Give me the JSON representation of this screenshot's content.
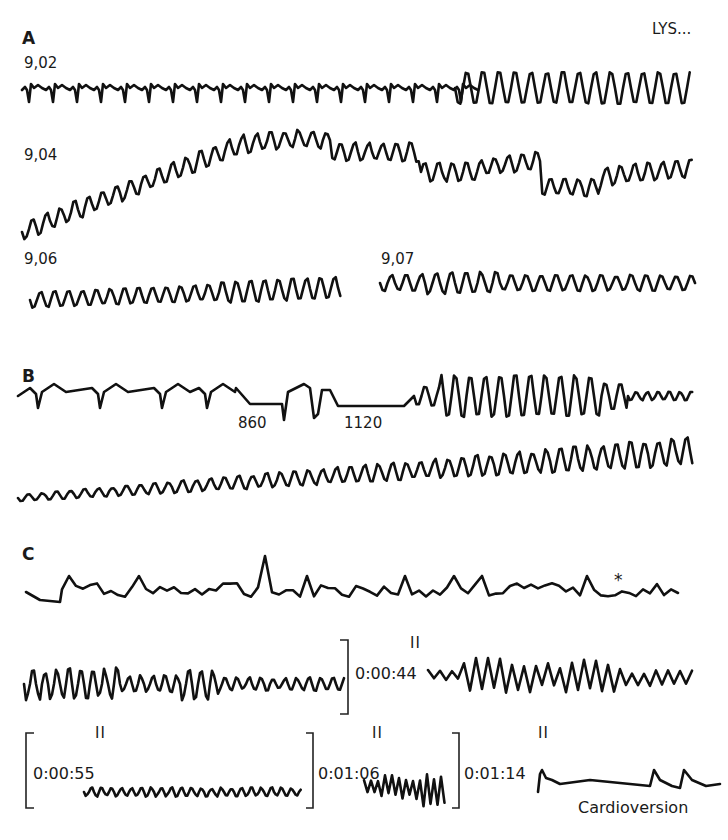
{
  "figure": {
    "corner_label": "LYS...",
    "panels": [
      {
        "letter": "A",
        "strips": [
          {
            "time_label": "9,02",
            "description": "narrow-complex rhythm transitioning to rapid polymorphic ventricular tachycardia"
          },
          {
            "time_label": "9,04",
            "description": "polymorphic ventricular tachycardia with undulating baseline"
          },
          {
            "time_label": "9,06",
            "description": "ventricular tachycardia"
          },
          {
            "time_label": "9,07",
            "description": "ventricular tachycardia"
          }
        ]
      },
      {
        "letter": "B",
        "strips": [
          {
            "interval_labels": [
              "860",
              "1120"
            ],
            "description": "pauses followed by torsades-type ventricular tachycardia"
          },
          {
            "description": "ventricular tachycardia with increasing amplitude"
          }
        ]
      },
      {
        "letter": "C",
        "asterisk": "*",
        "strips": [
          {
            "description": "irregular rhythm, marked beat (*)"
          },
          {
            "description": "polymorphic ventricular tachycardia"
          },
          {
            "lead": "II",
            "time_label": "0:00:44",
            "description": "ventricular fibrillation, coarse"
          },
          {
            "lead": "II",
            "time_label": "0:00:55",
            "description": "fine ventricular fibrillation"
          },
          {
            "lead": "II",
            "time_label": "0:01:06",
            "description": "ventricular fibrillation with artifact"
          },
          {
            "lead": "II",
            "time_label": "0:01:14",
            "description": "post-shock rhythm"
          }
        ],
        "footer_label": "Cardioversion"
      }
    ]
  },
  "colors": {
    "trace": "#111111",
    "background": "#ffffff"
  }
}
